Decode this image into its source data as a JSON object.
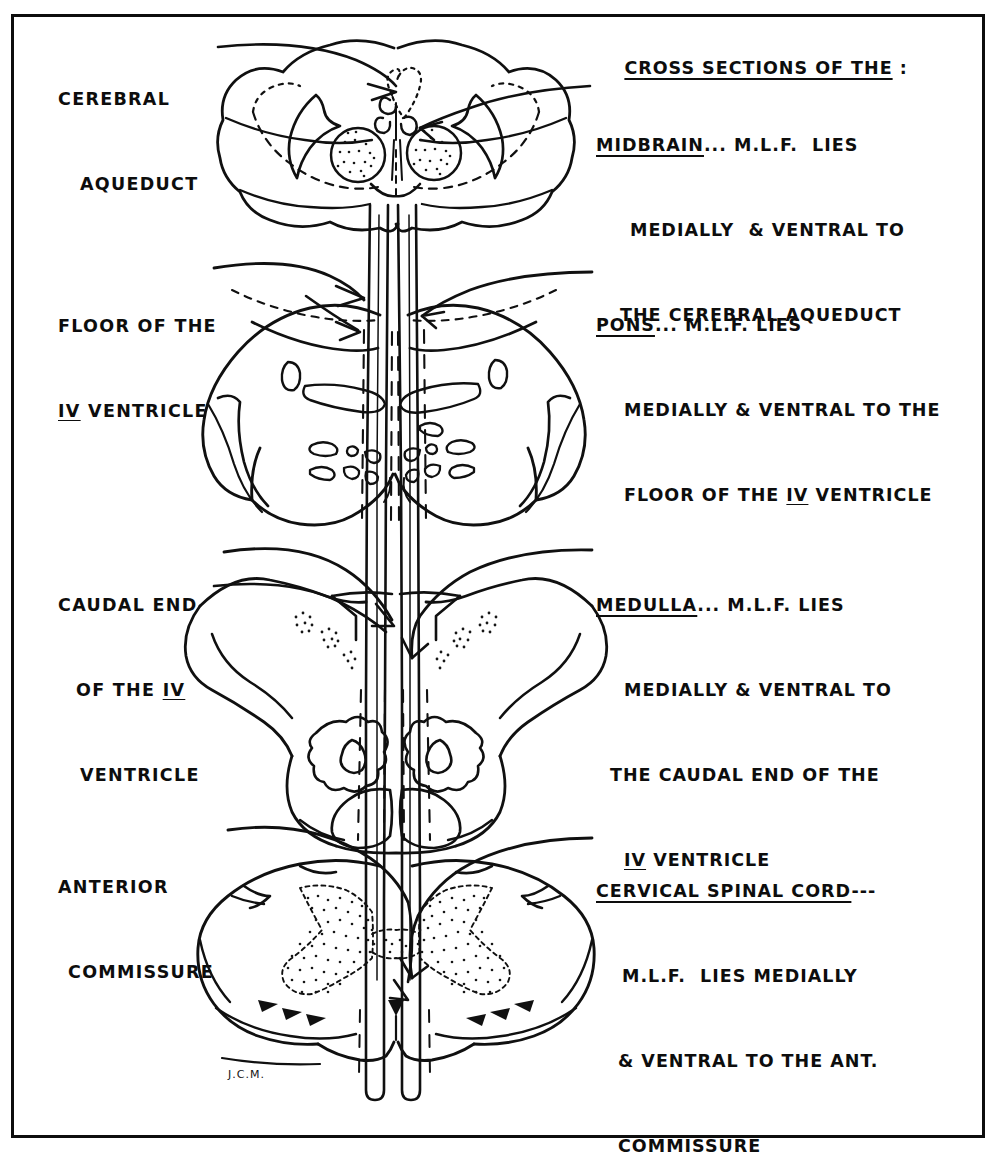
{
  "figure": {
    "kind": "hand-drawn-anatomical-plate",
    "border_color": "#0d0d0d",
    "ink_color": "#101010",
    "background_color": "#ffffff",
    "signature": "J.C.M."
  },
  "header": {
    "title": "CROSS SECTIONS OF THE",
    "colon": " :"
  },
  "left_labels": [
    {
      "id": "cerebral-aqueduct",
      "lines": [
        "CEREBRAL",
        "AQUEDUCT"
      ]
    },
    {
      "id": "floor-iv-ventricle",
      "lines": [
        "FLOOR OF THE",
        "IV VENTRICLE"
      ],
      "underline_token": "IV"
    },
    {
      "id": "caudal-end-iv-ventricle",
      "lines": [
        "CAUDAL END",
        "OF THE  IV",
        "VENTRICLE"
      ],
      "underline_token": "IV"
    },
    {
      "id": "anterior-commissure",
      "lines": [
        "ANTERIOR",
        "COMMISSURE"
      ]
    }
  ],
  "right_entries": [
    {
      "id": "midbrain",
      "title": "MIDBRAIN",
      "dashes": "...",
      "lines": [
        "M.L.F.  LIES",
        "MEDIALLY  & VENTRAL TO",
        "THE CEREBRAL AQUEDUCT"
      ]
    },
    {
      "id": "pons",
      "title": "PONS",
      "dashes": "...",
      "lines": [
        "M.L.F. LIES",
        "MEDIALLY & VENTRAL TO THE",
        "FLOOR OF THE IV VENTRICLE"
      ]
    },
    {
      "id": "medulla",
      "title": "MEDULLA",
      "dashes": "...",
      "lines": [
        "M.L.F. LIES",
        "MEDIALLY & VENTRAL TO",
        "THE CAUDAL END OF THE",
        "IV VENTRICLE"
      ]
    },
    {
      "id": "cervical-spinal-cord",
      "title": "CERVICAL SPINAL CORD",
      "dashes": "---",
      "lines": [
        "M.L.F.  LIES MEDIALLY",
        "& VENTRAL TO THE ANT.",
        "COMMISSURE"
      ]
    }
  ],
  "sections": [
    {
      "id": "midbrain-section",
      "name": "Midbrain cross section",
      "features": [
        "cerebral peduncles",
        "red nuclei (stippled)",
        "cerebral aqueduct (dotted)",
        "substantia nigra (dashed band)"
      ]
    },
    {
      "id": "pons-section",
      "name": "Pons cross section",
      "features": [
        "transverse pontine fibers",
        "middle cerebellar peduncles",
        "floor of IV ventricle"
      ]
    },
    {
      "id": "medulla-section",
      "name": "Medulla cross section",
      "features": [
        "inferior olivary nuclei",
        "pyramids",
        "stippled nuclei",
        "caudal end of IV ventricle"
      ]
    },
    {
      "id": "spinal-cord-section",
      "name": "Cervical spinal cord cross section",
      "features": [
        "butterfly gray matter (stippled)",
        "anterior commissure",
        "anterior white commissure"
      ]
    }
  ],
  "tract": {
    "id": "mlf-tract",
    "label": "M.L.F.",
    "description": "paired vertical bands descending through all four sections"
  }
}
